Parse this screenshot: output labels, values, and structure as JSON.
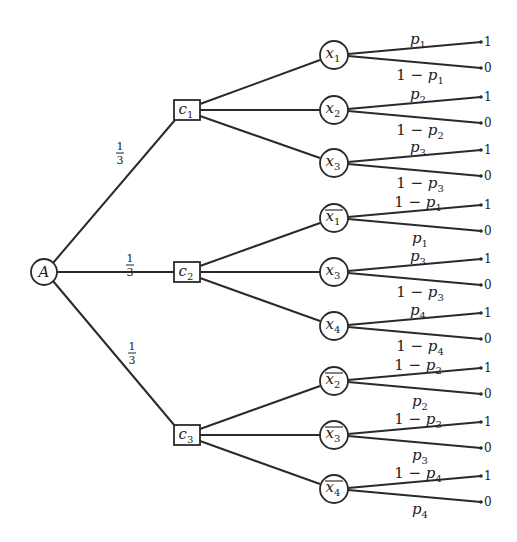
{
  "root": {
    "label": "A"
  },
  "edge_probs": [
    "1/3",
    "1/3",
    "1/3"
  ],
  "clauses": [
    {
      "label": "c",
      "sub": "1",
      "vars": [
        {
          "label": "x",
          "sub": "1",
          "negated": false,
          "up": "p",
          "up_sub": "1",
          "up_prefix": "",
          "down": "p",
          "down_sub": "1",
          "down_prefix": "1 − "
        },
        {
          "label": "x",
          "sub": "2",
          "negated": false,
          "up": "p",
          "up_sub": "2",
          "up_prefix": "",
          "down": "p",
          "down_sub": "2",
          "down_prefix": "1 − "
        },
        {
          "label": "x",
          "sub": "3",
          "negated": false,
          "up": "p",
          "up_sub": "3",
          "up_prefix": "",
          "down": "p",
          "down_sub": "3",
          "down_prefix": "1 − "
        }
      ]
    },
    {
      "label": "c",
      "sub": "2",
      "vars": [
        {
          "label": "x",
          "sub": "1",
          "negated": true,
          "up": "p",
          "up_sub": "1",
          "up_prefix": "1 − ",
          "down": "p",
          "down_sub": "1",
          "down_prefix": ""
        },
        {
          "label": "x",
          "sub": "3",
          "negated": false,
          "up": "p",
          "up_sub": "3",
          "up_prefix": "",
          "down": "p",
          "down_sub": "3",
          "down_prefix": "1 − "
        },
        {
          "label": "x",
          "sub": "4",
          "negated": false,
          "up": "p",
          "up_sub": "4",
          "up_prefix": "",
          "down": "p",
          "down_sub": "4",
          "down_prefix": "1 − "
        }
      ]
    },
    {
      "label": "c",
      "sub": "3",
      "vars": [
        {
          "label": "x",
          "sub": "2",
          "negated": true,
          "up": "p",
          "up_sub": "2",
          "up_prefix": "1 − ",
          "down": "p",
          "down_sub": "2",
          "down_prefix": ""
        },
        {
          "label": "x",
          "sub": "3",
          "negated": true,
          "up": "p",
          "up_sub": "3",
          "up_prefix": "1 − ",
          "down": "p",
          "down_sub": "3",
          "down_prefix": ""
        },
        {
          "label": "x",
          "sub": "4",
          "negated": true,
          "up": "p",
          "up_sub": "4",
          "up_prefix": "1 − ",
          "down": "p",
          "down_sub": "4",
          "down_prefix": ""
        }
      ]
    }
  ],
  "leaf_values": {
    "top": "1",
    "bottom": "0"
  }
}
